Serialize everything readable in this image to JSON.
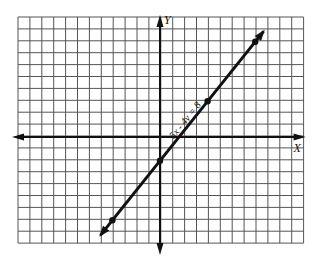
{
  "chart_data": {
    "type": "line",
    "title": "",
    "equation": "5x - 4y = 8",
    "xlabel": "X",
    "ylabel": "Y",
    "grid": true,
    "xlim": [
      -12,
      12
    ],
    "ylim": [
      -9,
      10
    ],
    "line": {
      "slope": 1.25,
      "intercept": -2
    },
    "points": [
      {
        "x": -4,
        "y": -7
      },
      {
        "x": 0,
        "y": -2
      },
      {
        "x": 4,
        "y": 3
      },
      {
        "x": 8,
        "y": 8
      }
    ],
    "line_extent": {
      "x_start": -5,
      "x_end": 8.7
    }
  },
  "labels": {
    "x_axis": "X",
    "y_axis": "Y",
    "equation": "5x - 4y = 8"
  },
  "colors": {
    "grid": "#555555",
    "axis": "#111111",
    "line": "#111111",
    "background": "#ffffff"
  },
  "layout": {
    "grid_left": 18,
    "grid_top": 17,
    "cell": 11.9,
    "cols": 24,
    "rows": 19,
    "origin_px": [
      160,
      137
    ]
  }
}
